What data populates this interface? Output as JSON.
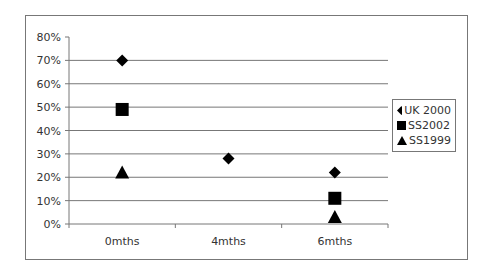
{
  "chart_data": {
    "type": "scatter",
    "title": "",
    "xlabel": "",
    "ylabel": "",
    "categories": [
      "0mths",
      "4mths",
      "6mths"
    ],
    "y_ticks": [
      "0%",
      "10%",
      "20%",
      "30%",
      "40%",
      "50%",
      "60%",
      "70%",
      "80%"
    ],
    "ylim": [
      0,
      80
    ],
    "grid": true,
    "legend_position": "right",
    "series": [
      {
        "name": "UK 2000",
        "marker": "diamond",
        "values": [
          70,
          28,
          22
        ]
      },
      {
        "name": "SS2002",
        "marker": "square",
        "values": [
          49,
          null,
          11
        ]
      },
      {
        "name": "SS1999",
        "marker": "triangle",
        "values": [
          22,
          null,
          3
        ]
      }
    ]
  },
  "legend": {
    "items": [
      "UK 2000",
      "SS2002",
      "SS1999"
    ]
  }
}
